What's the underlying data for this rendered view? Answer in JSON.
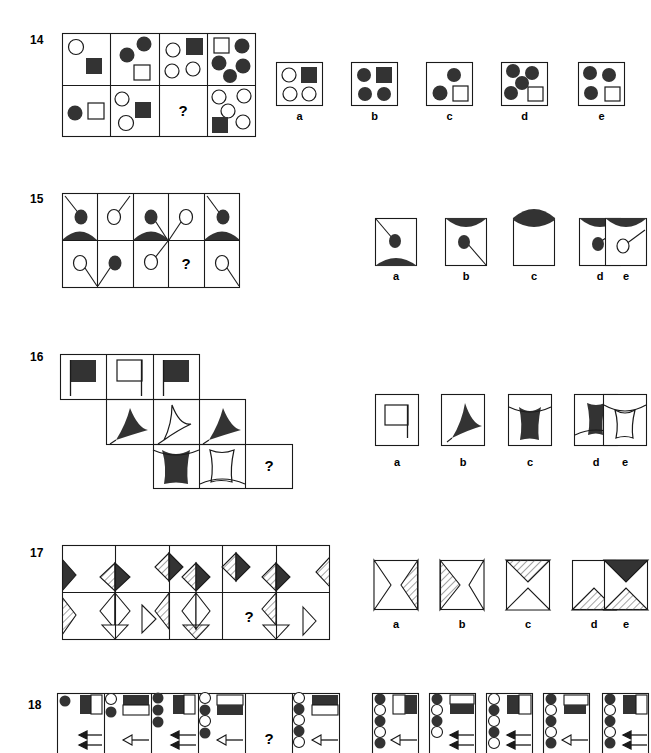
{
  "page": {
    "kind": "non-verbal-reasoning-test",
    "question_mark": "?",
    "option_letters": [
      "a",
      "b",
      "c",
      "d",
      "e"
    ]
  },
  "colors": {
    "ink": "#1a1a1a",
    "fill_dark": "#333333",
    "paper": "#ffffff",
    "hatch": "#555555"
  },
  "items": [
    {
      "number": "14",
      "type": "2x4 matrix of circles and squares",
      "matrix": {
        "rows": 2,
        "cols": 4,
        "cells": [
          {
            "row": 0,
            "col": 0,
            "contents": "open circle top-left, filled square center"
          },
          {
            "row": 0,
            "col": 1,
            "contents": "two filled circles, open square"
          },
          {
            "row": 0,
            "col": 2,
            "contents": "open circle, filled square, two open circles"
          },
          {
            "row": 0,
            "col": 3,
            "contents": "open square, four filled circles"
          },
          {
            "row": 1,
            "col": 0,
            "contents": "filled circle, open square"
          },
          {
            "row": 1,
            "col": 1,
            "contents": "open circle, filled square, open circle"
          },
          {
            "row": 1,
            "col": 2,
            "contents": "question mark"
          },
          {
            "row": 1,
            "col": 3,
            "contents": "four open circles, filled square"
          }
        ]
      },
      "options": [
        {
          "letter": "a",
          "contents": "open circle, filled square, two open circles"
        },
        {
          "letter": "b",
          "contents": "filled circle, filled square, two filled circles"
        },
        {
          "letter": "c",
          "contents": "filled circle, filled circle, open square"
        },
        {
          "letter": "d",
          "contents": "four filled circles, open square"
        },
        {
          "letter": "e",
          "contents": "three filled circles, open square"
        }
      ]
    },
    {
      "number": "15",
      "type": "2x5 matrix with circles on stalks and filled arcs",
      "matrix": {
        "rows": 2,
        "cols": 5,
        "cells": [
          {
            "row": 0,
            "col": 0,
            "contents": "filled circle on stalk from top-left, filled arc hump below"
          },
          {
            "row": 0,
            "col": 1,
            "contents": "open circle on stalk from top-right, filled arc dip below"
          },
          {
            "row": 0,
            "col": 2,
            "contents": "filled circle on stalk, filled arc hump below"
          },
          {
            "row": 0,
            "col": 3,
            "contents": "open circle on stalk from bottom-left"
          },
          {
            "row": 0,
            "col": 4,
            "contents": "filled circle on stalk from top-left, filled arc hump below"
          },
          {
            "row": 1,
            "col": 0,
            "contents": "open circle with stalk going down-right"
          },
          {
            "row": 1,
            "col": 1,
            "contents": "filled circle with stalk going down-left"
          },
          {
            "row": 1,
            "col": 2,
            "contents": "open circle with stalk going up-right"
          },
          {
            "row": 1,
            "col": 3,
            "contents": "question mark"
          },
          {
            "row": 1,
            "col": 4,
            "contents": "open circle with stalk going down-right"
          }
        ]
      },
      "options": [
        {
          "letter": "a",
          "contents": "filled circle on stalk from top-left, filled arc hump at bottom"
        },
        {
          "letter": "b",
          "contents": "filled arc at top, filled circle with stalk to bottom-right"
        },
        {
          "letter": "c",
          "contents": "filled arc at top only, empty square"
        },
        {
          "letter": "d",
          "contents": "filled arc at top, filled circle with stalk to top-right"
        },
        {
          "letter": "e",
          "contents": "filled arc at top, open circle with stalk to top-right"
        }
      ]
    },
    {
      "number": "16",
      "type": "staggered 3x3 matrix of flags and curved shapes",
      "matrix": {
        "rows": 3,
        "cols": 3,
        "cells": [
          {
            "row": 0,
            "col": 0,
            "contents": "filled flag on pole"
          },
          {
            "row": 0,
            "col": 1,
            "contents": "open flag on pole"
          },
          {
            "row": 0,
            "col": 2,
            "contents": "filled flag on pole"
          },
          {
            "row": 1,
            "col": 0,
            "contents": "filled curved sail pointing up-left"
          },
          {
            "row": 1,
            "col": 1,
            "contents": "open curved sail pointing right"
          },
          {
            "row": 1,
            "col": 2,
            "contents": "filled curved sail pointing up-left"
          },
          {
            "row": 2,
            "col": 0,
            "contents": "filled concave cup shape"
          },
          {
            "row": 2,
            "col": 1,
            "contents": "open concave cup shape"
          },
          {
            "row": 2,
            "col": 2,
            "contents": "question mark"
          }
        ]
      },
      "options": [
        {
          "letter": "a",
          "contents": "open square flag on pole"
        },
        {
          "letter": "b",
          "contents": "filled curved sail pointing up-left"
        },
        {
          "letter": "c",
          "contents": "filled concave cup, narrow waist"
        },
        {
          "letter": "d",
          "contents": "filled concave cup, wide top"
        },
        {
          "letter": "e",
          "contents": "open concave cup shape"
        }
      ]
    },
    {
      "number": "17",
      "type": "2x5 matrix of diamonds and bowtie shapes with shading",
      "matrix": {
        "rows": 2,
        "cols": 5,
        "cells": [
          {
            "row": 0,
            "col": 0,
            "contents": "filled half diamond at left edge"
          },
          {
            "row": 0,
            "col": 1,
            "contents": "hatched diamond left, filled diamond right"
          },
          {
            "row": 0,
            "col": 2,
            "contents": "hatched diamond left, filled diamond right"
          },
          {
            "row": 0,
            "col": 3,
            "contents": "hatched diamond left, filled diamond right"
          },
          {
            "row": 0,
            "col": 4,
            "contents": "hatched half diamond at right edge"
          },
          {
            "row": 1,
            "col": 0,
            "contents": "hatched bowtie at left edge"
          },
          {
            "row": 1,
            "col": 1,
            "contents": "open bowtie shape"
          },
          {
            "row": 1,
            "col": 2,
            "contents": "hatched bowtie left, open bowtie"
          },
          {
            "row": 1,
            "col": 3,
            "contents": "question mark"
          },
          {
            "row": 1,
            "col": 4,
            "contents": "hatched bowtie upper, open bowtie lower"
          }
        ]
      },
      "options": [
        {
          "letter": "a",
          "contents": "open bowtie with hatched right wedge"
        },
        {
          "letter": "b",
          "contents": "hatched left wedge with open bowtie"
        },
        {
          "letter": "c",
          "contents": "hatched top wedge with open bottom wedge"
        },
        {
          "letter": "d",
          "contents": "open top with hatched bottom wedge"
        },
        {
          "letter": "e",
          "contents": "filled top wedge with hatched bottom wedge"
        }
      ]
    },
    {
      "number": "18",
      "type": "2x5 matrix of circle columns, bar blocks and arrows",
      "matrix": {
        "rows": 1,
        "cols": 5,
        "cells": [
          {
            "row": 0,
            "col": 0,
            "contents": "one filled circle, half-filled bar block, two solid arrows"
          },
          {
            "row": 0,
            "col": 1,
            "contents": "open and filled circles, bar block filled top, one open arrow"
          },
          {
            "row": 0,
            "col": 2,
            "contents": "filled circles column, bar block, two solid arrows"
          },
          {
            "row": 0,
            "col": 3,
            "contents": "mixed circles column, bar block filled bottom, one open arrow"
          },
          {
            "row": 0,
            "col": 4,
            "contents": "question mark"
          },
          {
            "row": 0,
            "col": 5,
            "contents": "circle column, bar block filled top, one open arrow"
          }
        ]
      },
      "options": [
        {
          "letter": "a",
          "contents": "circle column alternating, bar filled right, open arrow"
        },
        {
          "letter": "b",
          "contents": "circle column, bar filled lower, two solid arrows"
        },
        {
          "letter": "c",
          "contents": "circle column, bar filled right, two solid arrows"
        },
        {
          "letter": "d",
          "contents": "circle column, bar filled middle, open arrow"
        },
        {
          "letter": "e",
          "contents": "circle column, bar filled left, two solid arrows"
        }
      ]
    }
  ]
}
